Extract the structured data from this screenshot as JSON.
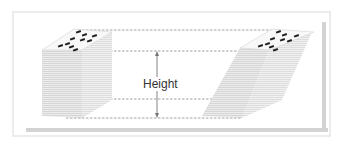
{
  "diagram": {
    "label": "Height",
    "colors": {
      "frame": "#e3e3e3",
      "frame_shadow": "#cfcfcf",
      "stack_side": "#e8e8e8",
      "stack_lines": "#d4d4d4",
      "stack_top": "#f7f7f7",
      "chip": "#222222",
      "dashed": "#8a8a8a",
      "arrow": "#777777",
      "text": "#333333"
    },
    "left_stack": {
      "shape": "upright stack",
      "chips_on_top": 10
    },
    "right_stack": {
      "shape": "sheared stack",
      "chips_on_top": 10
    },
    "guides": {
      "dashed_lines_y": [
        30,
        51,
        99,
        118
      ]
    }
  }
}
